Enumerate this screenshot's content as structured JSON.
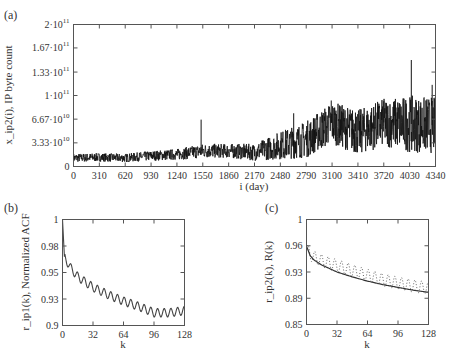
{
  "figure": {
    "panels": [
      "(a)",
      "(b)",
      "(c)"
    ]
  },
  "chart_data": [
    {
      "id": "a",
      "panel_label": "(a)",
      "type": "line",
      "title": "",
      "xlabel": "i (day)",
      "ylabel": "x_ip2(i), IP byte count",
      "xlim": [
        0,
        4340
      ],
      "ylim": [
        0,
        200000000000
      ],
      "x_ticks": [
        0,
        310,
        620,
        930,
        1240,
        1550,
        1860,
        2170,
        2480,
        2790,
        3100,
        3410,
        3720,
        4030,
        4340
      ],
      "x_tick_labels": [
        "0",
        "310",
        "620",
        "930",
        "1240",
        "1550",
        "1860",
        "2170",
        "2480",
        "2790",
        "3100",
        "3410",
        "3720",
        "4030",
        "4340"
      ],
      "y_ticks": [
        0,
        33300000000,
        66700000000,
        100000000000,
        133000000000,
        167000000000,
        200000000000
      ],
      "y_tick_labels": [
        "0",
        "3.33·10^10",
        "6.67·10^10",
        "1·10^11",
        "1.33·10^11",
        "1.67·10^11",
        "2·10^11"
      ],
      "grid": false,
      "series": [
        {
          "name": "IP byte count",
          "color": "#111111",
          "envelope_x": [
            0,
            310,
            620,
            930,
            1240,
            1550,
            1860,
            2170,
            2480,
            2790,
            3100,
            3410,
            3720,
            4030,
            4340
          ],
          "envelope_center": [
            12,
            13,
            12,
            15,
            17,
            22,
            22,
            20,
            30,
            38,
            62,
            48,
            62,
            60,
            58
          ],
          "envelope_spread": [
            6,
            6,
            6,
            7,
            8,
            10,
            10,
            12,
            20,
            26,
            30,
            32,
            34,
            40,
            40
          ],
          "peaks": [
            {
              "x": 1530,
              "y": 66
            },
            {
              "x": 2640,
              "y": 75
            },
            {
              "x": 3090,
              "y": 93
            },
            {
              "x": 3380,
              "y": 76
            },
            {
              "x": 3720,
              "y": 92
            },
            {
              "x": 4050,
              "y": 150
            },
            {
              "x": 4300,
              "y": 115
            }
          ],
          "units_note": "envelope values in units of 1e9"
        }
      ]
    },
    {
      "id": "b",
      "panel_label": "(b)",
      "type": "line",
      "title": "",
      "xlabel": "k",
      "ylabel": "r_ip1(k), Normalized ACF",
      "xlim": [
        0,
        128
      ],
      "ylim": [
        0.9,
        1.0
      ],
      "x_ticks": [
        0,
        32,
        64,
        96,
        128
      ],
      "x_tick_labels": [
        "0",
        "32",
        "64",
        "96",
        "128"
      ],
      "y_ticks": [
        0.9,
        0.925,
        0.95,
        0.975,
        1.0
      ],
      "y_tick_labels": [
        "0.9",
        "0.93",
        "0.95",
        "0.98",
        "1"
      ],
      "grid": false,
      "series": [
        {
          "name": "r_ip1(k)",
          "color": "#444444",
          "style": "solid",
          "trend_k": [
            0,
            2,
            8,
            16,
            32,
            48,
            64,
            80,
            96,
            112,
            128
          ],
          "trend_values": [
            1.0,
            0.965,
            0.955,
            0.946,
            0.936,
            0.929,
            0.923,
            0.918,
            0.912,
            0.912,
            0.914
          ],
          "oscillation_period": 7,
          "oscillation_amplitude": 0.004
        }
      ]
    },
    {
      "id": "c",
      "panel_label": "(c)",
      "type": "line",
      "title": "",
      "xlabel": "k",
      "ylabel": "r_ip2(k),  R(k)",
      "xlim": [
        0,
        128
      ],
      "ylim": [
        0.85,
        1.0
      ],
      "x_ticks": [
        0,
        32,
        64,
        96,
        128
      ],
      "x_tick_labels": [
        "0",
        "32",
        "64",
        "96",
        "128"
      ],
      "y_ticks": [
        0.85,
        0.8875,
        0.925,
        0.9625,
        1.0
      ],
      "y_tick_labels": [
        "0.85",
        "0.89",
        "0.93",
        "0.96",
        "1"
      ],
      "grid": false,
      "series": [
        {
          "name": "R(k)",
          "color": "#333333",
          "style": "solid",
          "k": [
            0,
            4,
            8,
            16,
            32,
            48,
            64,
            80,
            96,
            112,
            128
          ],
          "values": [
            0.962,
            0.948,
            0.942,
            0.935,
            0.925,
            0.918,
            0.912,
            0.907,
            0.903,
            0.899,
            0.896
          ]
        },
        {
          "name": "r_ip2(k)",
          "color": "#555555",
          "style": "dotted",
          "trend_k": [
            0,
            4,
            8,
            16,
            32,
            48,
            64,
            80,
            96,
            112,
            128
          ],
          "trend_values": [
            0.958,
            0.95,
            0.946,
            0.941,
            0.934,
            0.927,
            0.92,
            0.914,
            0.909,
            0.905,
            0.902
          ],
          "oscillation_period": 7,
          "oscillation_amplitude": 0.009
        }
      ]
    }
  ]
}
